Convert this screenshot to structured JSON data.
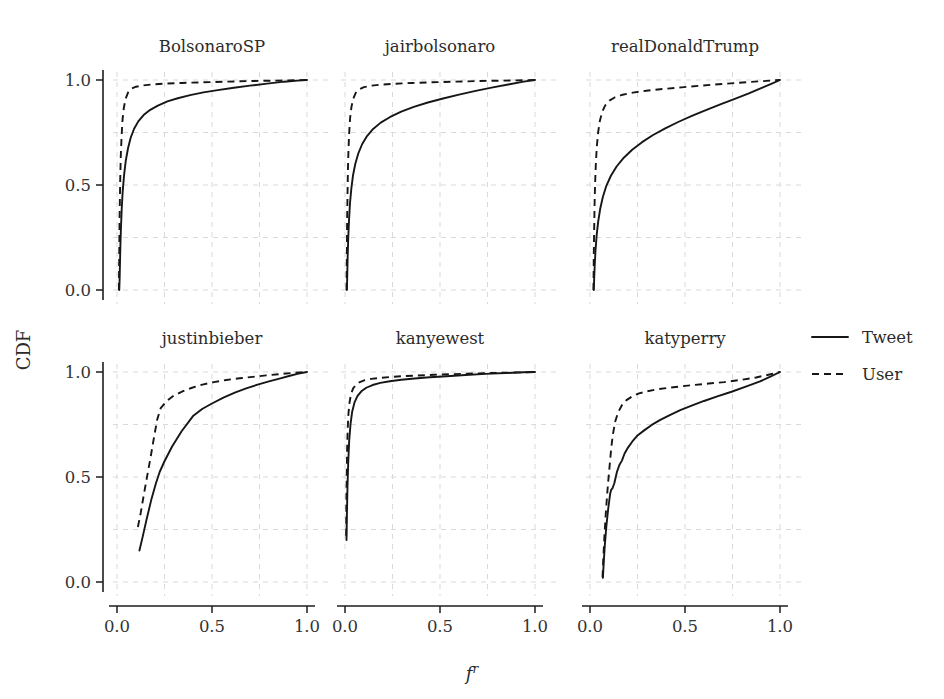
{
  "figure": {
    "xlabel": "f",
    "xlabel_sup": "r",
    "ylabel": "CDF"
  },
  "legend": {
    "position": "right",
    "items": [
      {
        "label": "Tweet",
        "style": "solid"
      },
      {
        "label": "User",
        "style": "dashed"
      }
    ]
  },
  "chart_data": {
    "type": "line",
    "title": "",
    "xlabel": "f^r",
    "ylabel": "CDF",
    "xlim": [
      0.0,
      1.0
    ],
    "ylim": [
      0.0,
      1.0
    ],
    "xticks": [
      "0.0",
      "0.5",
      "1.0"
    ],
    "yticks": [
      "0.0",
      "0.5",
      "1.0"
    ],
    "xtick_values": [
      0.0,
      0.5,
      1.0
    ],
    "ytick_values": [
      0.0,
      0.5,
      1.0
    ],
    "grid": true,
    "legend_position": "right",
    "layout": {
      "rows": 2,
      "cols": 3
    },
    "panels": [
      {
        "title": "BolsonaroSP",
        "row": 0,
        "col": 0,
        "series": [
          {
            "name": "Tweet",
            "style": "solid",
            "x": [
              0.012,
              0.014,
              0.016,
              0.018,
              0.021,
              0.025,
              0.03,
              0.037,
              0.046,
              0.058,
              0.072,
              0.09,
              0.112,
              0.14,
              0.175,
              0.215,
              0.265,
              0.32,
              0.385,
              0.455,
              0.53,
              0.615,
              0.7,
              0.79,
              0.88,
              0.95,
              1.0
            ],
            "y": [
              0.0,
              0.06,
              0.14,
              0.215,
              0.3,
              0.39,
              0.47,
              0.545,
              0.615,
              0.675,
              0.725,
              0.768,
              0.803,
              0.833,
              0.858,
              0.878,
              0.898,
              0.913,
              0.928,
              0.941,
              0.952,
              0.963,
              0.973,
              0.983,
              0.992,
              0.997,
              1.0
            ]
          },
          {
            "name": "User",
            "style": "dashed",
            "x": [
              0.01,
              0.011,
              0.012,
              0.013,
              0.015,
              0.017,
              0.02,
              0.024,
              0.029,
              0.036,
              0.045,
              0.058,
              0.075,
              0.1,
              0.135,
              0.185,
              0.25,
              0.34,
              0.45,
              0.57,
              0.7,
              0.83,
              0.93,
              1.0
            ],
            "y": [
              0.0,
              0.085,
              0.19,
              0.3,
              0.42,
              0.53,
              0.64,
              0.73,
              0.81,
              0.868,
              0.91,
              0.94,
              0.958,
              0.968,
              0.974,
              0.979,
              0.983,
              0.986,
              0.989,
              0.992,
              0.995,
              0.997,
              0.999,
              1.0
            ]
          }
        ]
      },
      {
        "title": "jairbolsonaro",
        "row": 0,
        "col": 1,
        "series": [
          {
            "name": "Tweet",
            "style": "solid",
            "x": [
              0.01,
              0.012,
              0.014,
              0.017,
              0.021,
              0.026,
              0.033,
              0.042,
              0.054,
              0.07,
              0.09,
              0.116,
              0.148,
              0.188,
              0.238,
              0.296,
              0.362,
              0.436,
              0.516,
              0.6,
              0.688,
              0.778,
              0.866,
              0.94,
              1.0
            ],
            "y": [
              0.0,
              0.075,
              0.16,
              0.245,
              0.33,
              0.41,
              0.48,
              0.545,
              0.6,
              0.65,
              0.694,
              0.733,
              0.767,
              0.797,
              0.824,
              0.849,
              0.872,
              0.893,
              0.912,
              0.93,
              0.948,
              0.965,
              0.98,
              0.992,
              1.0
            ]
          },
          {
            "name": "User",
            "style": "dashed",
            "x": [
              0.008,
              0.009,
              0.01,
              0.011,
              0.013,
              0.015,
              0.018,
              0.022,
              0.027,
              0.034,
              0.043,
              0.056,
              0.074,
              0.1,
              0.138,
              0.192,
              0.262,
              0.35,
              0.455,
              0.575,
              0.7,
              0.83,
              0.935,
              1.0
            ],
            "y": [
              0.0,
              0.09,
              0.2,
              0.32,
              0.44,
              0.555,
              0.66,
              0.748,
              0.82,
              0.872,
              0.91,
              0.938,
              0.955,
              0.966,
              0.973,
              0.978,
              0.982,
              0.986,
              0.989,
              0.992,
              0.995,
              0.997,
              0.999,
              1.0
            ]
          }
        ]
      },
      {
        "title": "realDonaldTrump",
        "row": 0,
        "col": 2,
        "series": [
          {
            "name": "Tweet",
            "style": "solid",
            "x": [
              0.02,
              0.022,
              0.025,
              0.029,
              0.035,
              0.043,
              0.054,
              0.068,
              0.086,
              0.11,
              0.14,
              0.178,
              0.222,
              0.274,
              0.332,
              0.396,
              0.464,
              0.536,
              0.61,
              0.686,
              0.762,
              0.836,
              0.904,
              0.96,
              1.0
            ],
            "y": [
              0.0,
              0.055,
              0.12,
              0.19,
              0.26,
              0.326,
              0.388,
              0.444,
              0.496,
              0.544,
              0.588,
              0.63,
              0.668,
              0.704,
              0.738,
              0.77,
              0.8,
              0.829,
              0.857,
              0.884,
              0.91,
              0.936,
              0.962,
              0.984,
              1.0
            ]
          },
          {
            "name": "User",
            "style": "dashed",
            "x": [
              0.018,
              0.019,
              0.02,
              0.022,
              0.024,
              0.027,
              0.031,
              0.036,
              0.043,
              0.052,
              0.064,
              0.08,
              0.102,
              0.132,
              0.172,
              0.226,
              0.296,
              0.382,
              0.482,
              0.594,
              0.712,
              0.83,
              0.93,
              1.0
            ],
            "y": [
              0.0,
              0.08,
              0.175,
              0.29,
              0.405,
              0.51,
              0.605,
              0.685,
              0.752,
              0.806,
              0.848,
              0.879,
              0.902,
              0.918,
              0.93,
              0.94,
              0.949,
              0.957,
              0.965,
              0.974,
              0.982,
              0.99,
              0.996,
              1.0
            ]
          }
        ]
      },
      {
        "title": "justinbieber",
        "row": 1,
        "col": 0,
        "series": [
          {
            "name": "Tweet",
            "style": "solid",
            "x": [
              0.118,
              0.135,
              0.155,
              0.18,
              0.205,
              0.225,
              0.25,
              0.29,
              0.34,
              0.4,
              0.45,
              0.5,
              0.56,
              0.62,
              0.68,
              0.74,
              0.8,
              0.86,
              0.91,
              0.955,
              1.0
            ],
            "y": [
              0.15,
              0.215,
              0.295,
              0.39,
              0.47,
              0.525,
              0.575,
              0.645,
              0.718,
              0.79,
              0.825,
              0.85,
              0.878,
              0.902,
              0.922,
              0.94,
              0.955,
              0.97,
              0.982,
              0.992,
              1.0
            ]
          },
          {
            "name": "User",
            "style": "dashed",
            "x": [
              0.11,
              0.125,
              0.142,
              0.16,
              0.178,
              0.195,
              0.212,
              0.23,
              0.262,
              0.3,
              0.345,
              0.395,
              0.45,
              0.51,
              0.575,
              0.645,
              0.715,
              0.785,
              0.855,
              0.915,
              0.96,
              1.0
            ],
            "y": [
              0.262,
              0.33,
              0.42,
              0.51,
              0.6,
              0.69,
              0.775,
              0.828,
              0.862,
              0.888,
              0.908,
              0.925,
              0.94,
              0.952,
              0.962,
              0.97,
              0.977,
              0.984,
              0.99,
              0.995,
              0.998,
              1.0
            ]
          }
        ]
      },
      {
        "title": "kanyewest",
        "row": 1,
        "col": 1,
        "series": [
          {
            "name": "Tweet",
            "style": "solid",
            "x": [
              0.008,
              0.01,
              0.013,
              0.017,
              0.022,
              0.029,
              0.038,
              0.05,
              0.066,
              0.086,
              0.112,
              0.145,
              0.186,
              0.236,
              0.296,
              0.366,
              0.446,
              0.536,
              0.634,
              0.738,
              0.844,
              0.94,
              1.0
            ],
            "y": [
              0.2,
              0.32,
              0.45,
              0.57,
              0.672,
              0.752,
              0.812,
              0.855,
              0.886,
              0.908,
              0.925,
              0.938,
              0.948,
              0.956,
              0.963,
              0.969,
              0.975,
              0.98,
              0.986,
              0.991,
              0.995,
              0.999,
              1.0
            ]
          },
          {
            "name": "User",
            "style": "dashed",
            "x": [
              0.006,
              0.007,
              0.009,
              0.011,
              0.014,
              0.018,
              0.024,
              0.032,
              0.043,
              0.058,
              0.078,
              0.104,
              0.138,
              0.182,
              0.236,
              0.302,
              0.38,
              0.47,
              0.572,
              0.684,
              0.8,
              0.91,
              1.0
            ],
            "y": [
              0.22,
              0.36,
              0.5,
              0.625,
              0.725,
              0.8,
              0.856,
              0.896,
              0.922,
              0.94,
              0.952,
              0.961,
              0.967,
              0.972,
              0.976,
              0.98,
              0.983,
              0.987,
              0.99,
              0.993,
              0.996,
              0.998,
              1.0
            ]
          }
        ]
      },
      {
        "title": "katyperry",
        "row": 1,
        "col": 2,
        "series": [
          {
            "name": "Tweet",
            "style": "solid",
            "x": [
              0.068,
              0.072,
              0.078,
              0.086,
              0.096,
              0.106,
              0.112,
              0.118,
              0.128,
              0.142,
              0.156,
              0.168,
              0.182,
              0.2,
              0.222,
              0.25,
              0.285,
              0.325,
              0.37,
              0.42,
              0.475,
              0.535,
              0.6,
              0.67,
              0.745,
              0.82,
              0.895,
              0.955,
              1.0
            ],
            "y": [
              0.02,
              0.09,
              0.175,
              0.265,
              0.35,
              0.42,
              0.44,
              0.445,
              0.47,
              0.525,
              0.56,
              0.578,
              0.612,
              0.64,
              0.668,
              0.698,
              0.722,
              0.748,
              0.772,
              0.795,
              0.818,
              0.84,
              0.862,
              0.884,
              0.906,
              0.93,
              0.955,
              0.98,
              1.0
            ]
          },
          {
            "name": "User",
            "style": "dashed",
            "x": [
              0.066,
              0.07,
              0.076,
              0.084,
              0.094,
              0.104,
              0.112,
              0.12,
              0.132,
              0.148,
              0.168,
              0.192,
              0.222,
              0.258,
              0.3,
              0.35,
              0.408,
              0.474,
              0.546,
              0.624,
              0.706,
              0.79,
              0.874,
              0.945,
              1.0
            ],
            "y": [
              0.022,
              0.11,
              0.22,
              0.34,
              0.46,
              0.56,
              0.64,
              0.7,
              0.762,
              0.808,
              0.842,
              0.866,
              0.884,
              0.898,
              0.908,
              0.917,
              0.924,
              0.931,
              0.938,
              0.945,
              0.952,
              0.962,
              0.974,
              0.988,
              1.0
            ]
          }
        ]
      }
    ]
  }
}
